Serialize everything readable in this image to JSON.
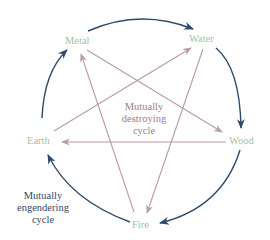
{
  "diagram": {
    "nodes": [
      {
        "id": "metal",
        "label": "Metal"
      },
      {
        "id": "water",
        "label": "Water"
      },
      {
        "id": "wood",
        "label": "Wood"
      },
      {
        "id": "fire",
        "label": "Fire"
      },
      {
        "id": "earth",
        "label": "Earth"
      }
    ],
    "destroying_caption": {
      "line1": "Mutually",
      "line2": "destroying",
      "line3": "cycle"
    },
    "engendering_caption": {
      "line1": "Mutually",
      "line2": "engendering",
      "line3": "cycle"
    },
    "engendering_cycle": [
      "Metal → Water",
      "Water → Wood",
      "Wood → Fire",
      "Fire → Earth",
      "Earth → Metal"
    ],
    "destroying_cycle": [
      "Metal → Wood",
      "Wood → Earth",
      "Earth → Water",
      "Water → Fire",
      "Fire → Metal"
    ],
    "colors": {
      "node_label": "#9cc4a8",
      "engendering_arrow": "#2e4a68",
      "destroying_arrow": "#b89aa8",
      "destroying_text": "#9b7d8c"
    }
  }
}
